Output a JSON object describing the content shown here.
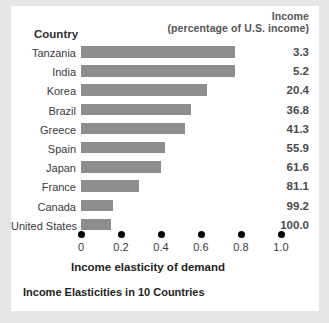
{
  "header": {
    "income_label": "Income",
    "income_sub_label": "(percentage of U.S. income)",
    "country_label": "Country"
  },
  "axis": {
    "title": "Income elasticity of demand",
    "ticks": [
      "0",
      "0.2",
      "0.4",
      "0.6",
      "0.8",
      "1.0"
    ]
  },
  "caption": "Income Elasticities in 10 Countries",
  "colors": {
    "bar": "#8d8d8d",
    "card_background": "#ffffff",
    "page_background": "#e6e6e4",
    "tick_dot": "#000000",
    "text": "#3a3a3c"
  },
  "chart_data": {
    "type": "bar",
    "orientation": "horizontal",
    "title": "Income Elasticities in 10 Countries",
    "xlabel": "Income elasticity of demand",
    "ylabel": "Country",
    "xlim": [
      0,
      1.0
    ],
    "xticks": [
      0,
      0.2,
      0.4,
      0.6,
      0.8,
      1.0
    ],
    "grid": false,
    "legend": false,
    "categories": [
      "Tanzania",
      "India",
      "Korea",
      "Brazil",
      "Greece",
      "Spain",
      "Japan",
      "France",
      "Canada",
      "United States"
    ],
    "values": [
      0.77,
      0.77,
      0.63,
      0.55,
      0.52,
      0.42,
      0.4,
      0.29,
      0.16,
      0.15
    ],
    "series": [
      {
        "name": "Income elasticity of demand",
        "values": [
          0.77,
          0.77,
          0.63,
          0.55,
          0.52,
          0.42,
          0.4,
          0.29,
          0.16,
          0.15
        ]
      }
    ],
    "annotations": {
      "column_header": "Income (percentage of U.S. income)",
      "labels": [
        "3.3",
        "5.2",
        "20.4",
        "36.8",
        "41.3",
        "55.9",
        "61.6",
        "81.1",
        "99.2",
        "100.0"
      ]
    },
    "rows": [
      {
        "country": "Tanzania",
        "elasticity": 0.77,
        "income": "3.3"
      },
      {
        "country": "India",
        "elasticity": 0.77,
        "income": "5.2"
      },
      {
        "country": "Korea",
        "elasticity": 0.63,
        "income": "20.4"
      },
      {
        "country": "Brazil",
        "elasticity": 0.55,
        "income": "36.8"
      },
      {
        "country": "Greece",
        "elasticity": 0.52,
        "income": "41.3"
      },
      {
        "country": "Spain",
        "elasticity": 0.42,
        "income": "55.9"
      },
      {
        "country": "Japan",
        "elasticity": 0.4,
        "income": "61.6"
      },
      {
        "country": "France",
        "elasticity": 0.29,
        "income": "81.1"
      },
      {
        "country": "Canada",
        "elasticity": 0.16,
        "income": "99.2"
      },
      {
        "country": "United States",
        "elasticity": 0.15,
        "income": "100.0"
      }
    ]
  }
}
